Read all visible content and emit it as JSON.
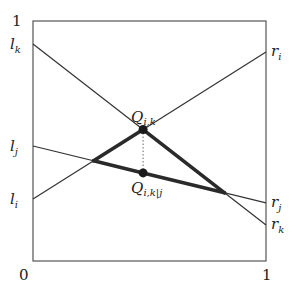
{
  "diagram": {
    "title": "",
    "axis": {
      "x_min": 0,
      "x_max": 1,
      "y_min": 0,
      "y_max": 1,
      "x_min_label": "0",
      "x_max_label": "1",
      "y_max_label": "1"
    },
    "colors": {
      "frame": "#555555",
      "line": "#333333",
      "thick": "#2a2a2a",
      "point": "#1a1a1a",
      "dotted": "#666666"
    },
    "lines": [
      {
        "id": "k",
        "left_label": "l",
        "left_sub": "k",
        "right_label": "r",
        "right_sub": "k",
        "left_y": 0.904,
        "right_y": 0.15
      },
      {
        "id": "j",
        "left_label": "l",
        "left_sub": "j",
        "right_label": "r",
        "right_sub": "j",
        "left_y": 0.479,
        "right_y": 0.242
      },
      {
        "id": "i",
        "left_label": "l",
        "left_sub": "i",
        "right_label": "r",
        "right_sub": "i",
        "left_y": 0.258,
        "right_y": 0.871
      }
    ],
    "points": [
      {
        "id": "Q_ik",
        "label": "Q",
        "sub": "i,k",
        "intersection": [
          "i",
          "k"
        ],
        "label_pos": "above"
      },
      {
        "id": "Q_ikj",
        "label": "Q",
        "sub": "i,k|j",
        "on_line": "j",
        "x_of": "Q_ik",
        "label_pos": "below"
      }
    ],
    "thick_path": [
      "ij",
      "Q_ik",
      "kj",
      "Q_ikj",
      "ij"
    ]
  }
}
